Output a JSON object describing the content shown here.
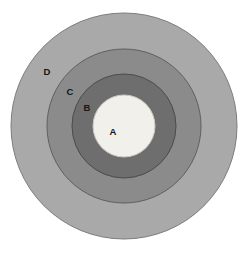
{
  "figure": {
    "kind": "concentric-circle-diagram",
    "background_color": "#ffffff",
    "width": 247,
    "height": 255
  },
  "chart_data": {
    "type": "pie",
    "title": "",
    "subtitle": "",
    "xlabel": "",
    "ylabel": "",
    "grid": false,
    "legend_position": "inline-labels",
    "annotations": [
      "A",
      "B",
      "C",
      "D"
    ],
    "center": {
      "x": 124,
      "y": 126
    },
    "categories": [
      "A",
      "B",
      "C",
      "D"
    ],
    "values": [
      31,
      52,
      77,
      113
    ],
    "rings": [
      {
        "label": "D",
        "order": 4,
        "radius": 113,
        "fill": "#a9a9a9",
        "stroke": "#7d7d7d",
        "label_x": 47,
        "label_y": 72
      },
      {
        "label": "C",
        "order": 3,
        "radius": 77,
        "fill": "#8b8b8b",
        "stroke": "#5f5f5f",
        "label_x": 70,
        "label_y": 92
      },
      {
        "label": "B",
        "order": 2,
        "radius": 52,
        "fill": "#6e6e6e",
        "stroke": "#4b4b4b",
        "label_x": 87,
        "label_y": 108
      },
      {
        "label": "A",
        "order": 1,
        "radius": 31,
        "fill": "#f2f0ea",
        "stroke": "#c9c7c1",
        "label_x": 113,
        "label_y": 132
      }
    ]
  },
  "labels": {
    "a": "A",
    "b": "B",
    "c": "C",
    "d": "D"
  }
}
